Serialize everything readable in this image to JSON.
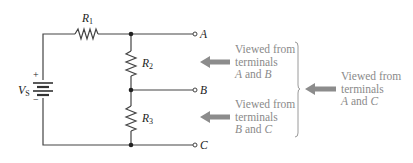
{
  "diagram": {
    "type": "circuit-schematic",
    "components": {
      "source": {
        "label": "V",
        "subscript": "S",
        "plus": "+",
        "minus": "−"
      },
      "r1": {
        "label": "R",
        "subscript": "1"
      },
      "r2": {
        "label": "R",
        "subscript": "2"
      },
      "r3": {
        "label": "R",
        "subscript": "3"
      }
    },
    "terminals": [
      {
        "id": "A",
        "label": "A"
      },
      {
        "id": "B",
        "label": "B"
      },
      {
        "id": "C",
        "label": "C"
      }
    ],
    "annotations": [
      {
        "line1": "Viewed from",
        "line2": "terminals",
        "t1": "A",
        "and": " and ",
        "t2": "B"
      },
      {
        "line1": "Viewed from",
        "line2": "terminals",
        "t1": "B",
        "and": " and ",
        "t2": "C"
      },
      {
        "line1": "Viewed from",
        "line2": "terminals",
        "t1": "A",
        "and": " and ",
        "t2": "C"
      }
    ],
    "colors": {
      "wire": "#444444",
      "annotation_text": "#8a8a8a",
      "arrow": "#8c8c8c",
      "brace": "#9a9a9a"
    }
  }
}
